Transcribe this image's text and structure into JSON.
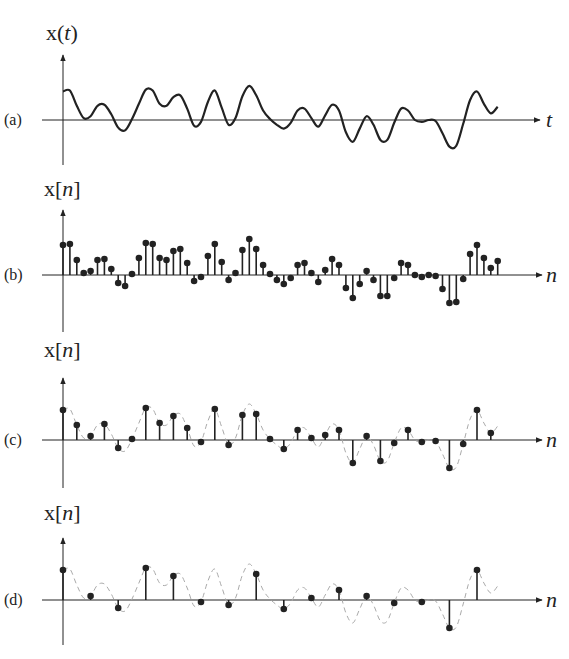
{
  "figure": {
    "panels": [
      {
        "id": "a",
        "label": "(a)",
        "ylabel_fn": "x",
        "ylabel_open": "(",
        "ylabel_var": "t",
        "ylabel_close": ")",
        "axis_var": "t",
        "type": "continuous"
      },
      {
        "id": "b",
        "label": "(b)",
        "ylabel_fn": "x",
        "ylabel_open": "[",
        "ylabel_var": "n",
        "ylabel_close": "]",
        "axis_var": "n",
        "type": "stem",
        "step": 1
      },
      {
        "id": "c",
        "label": "(c)",
        "ylabel_fn": "x",
        "ylabel_open": "[",
        "ylabel_var": "n",
        "ylabel_close": "]",
        "axis_var": "n",
        "type": "stem",
        "step": 2
      },
      {
        "id": "d",
        "label": "(d)",
        "ylabel_fn": "x",
        "ylabel_open": "[",
        "ylabel_var": "n",
        "ylabel_close": "]",
        "axis_var": "n",
        "type": "stem",
        "step": 4
      }
    ],
    "colors": {
      "ink": "#222222",
      "dashed": "#aaaaaa",
      "background": "#ffffff"
    }
  },
  "chart_data": {
    "type": "stem",
    "xlabel": "t / n",
    "ylabel": "x(t) / x[n]",
    "grid": false,
    "legend": null,
    "continuous_signal_description": "Irregular oscillating waveform; starts high, many peaks/troughs, dips negative after midpoint, sharp rise near end",
    "samples_b": [
      30,
      31,
      15,
      2,
      4,
      15,
      16,
      6,
      -8,
      -11,
      1,
      17,
      32,
      31,
      17,
      15,
      24,
      26,
      12,
      -6,
      -2,
      19,
      31,
      13,
      -5,
      2,
      25,
      36,
      26,
      10,
      1,
      -5,
      -9,
      -3,
      10,
      12,
      2,
      -7,
      5,
      16,
      10,
      -13,
      -23,
      -9,
      4,
      -5,
      -21,
      -21,
      -3,
      12,
      10,
      0,
      -2,
      0,
      -1,
      -14,
      -28,
      -27,
      -4,
      21,
      30,
      17,
      7,
      14
    ],
    "samples_c_step": 2,
    "samples_d_step": 4,
    "panels": [
      {
        "label": "(a)",
        "type": "line",
        "axis": "t"
      },
      {
        "label": "(b)",
        "type": "stem",
        "axis": "n",
        "sampling": "every sample"
      },
      {
        "label": "(c)",
        "type": "stem",
        "axis": "n",
        "sampling": "every 2nd sample, dashed envelope"
      },
      {
        "label": "(d)",
        "type": "stem",
        "axis": "n",
        "sampling": "every 4th sample, dashed envelope"
      }
    ]
  }
}
